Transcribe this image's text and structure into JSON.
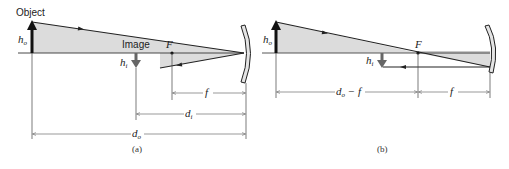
{
  "panels": {
    "a": {
      "caption": "(a)",
      "object_label": "Object",
      "image_label": "Image",
      "ho_label": "h",
      "ho_sub": "o",
      "hi_label": "h",
      "hi_sub": "i",
      "focal_point_label": "F",
      "f_label": "f",
      "di_label": "d",
      "di_sub": "i",
      "do_label": "d",
      "do_sub": "o"
    },
    "b": {
      "caption": "(b)",
      "ho_label": "h",
      "ho_sub": "o",
      "hi_label": "h",
      "hi_sub": "i",
      "focal_point_label": "F",
      "f_label": "f",
      "do_minus_f_label": "d",
      "do_minus_f_sub": "o",
      "do_minus_f_suffix": " − f"
    }
  },
  "colors": {
    "shade": "#dcdcdc",
    "line": "#222222",
    "mirror_fill": "#e4e4e4"
  }
}
